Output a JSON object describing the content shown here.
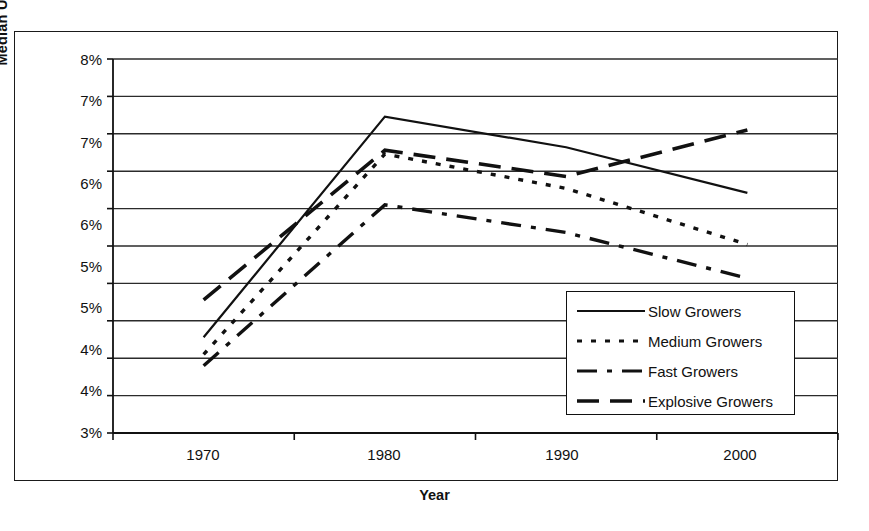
{
  "chart_data": {
    "type": "line",
    "title": "",
    "xlabel": "Year",
    "ylabel": "Median Unemployment Rate",
    "x": [
      1970,
      1980,
      1990,
      2000
    ],
    "xtick_labels": [
      "1970",
      "1980",
      "1990",
      "2000"
    ],
    "ytick_labels": [
      "3%",
      "4%",
      "4%",
      "5%",
      "5%",
      "6%",
      "6%",
      "7%",
      "7%",
      "8%"
    ],
    "ytick_values": [
      3.0,
      3.5,
      4.0,
      4.5,
      5.0,
      5.5,
      6.0,
      6.5,
      7.0,
      7.5,
      8.0
    ],
    "ylim": [
      3.0,
      8.0
    ],
    "grid": "horizontal",
    "legend_position": "inside-lower-right",
    "series": [
      {
        "name": "Slow Growers",
        "style": "solid",
        "values": [
          4.28,
          7.23,
          6.82,
          6.21
        ]
      },
      {
        "name": "Medium Growers",
        "style": "dotted",
        "values": [
          4.05,
          6.73,
          6.27,
          5.52
        ]
      },
      {
        "name": "Fast Growers",
        "style": "dash-dot",
        "values": [
          3.9,
          6.05,
          5.68,
          5.07
        ]
      },
      {
        "name": "Explosive Growers",
        "style": "long-dash",
        "values": [
          4.78,
          6.78,
          6.43,
          7.05
        ]
      }
    ]
  },
  "legend": {
    "items": [
      {
        "label": "Slow Growers",
        "style": "solid"
      },
      {
        "label": "Medium Growers",
        "style": "dotted"
      },
      {
        "label": "Fast Growers",
        "style": "dash-dot"
      },
      {
        "label": "Explosive Growers",
        "style": "long-dash"
      }
    ]
  },
  "axes": {
    "y_title": "Median Unemployment Rate",
    "x_title": "Year",
    "y_labels": [
      "8%",
      "7%",
      "7%",
      "6%",
      "6%",
      "5%",
      "5%",
      "4%",
      "4%",
      "3%"
    ],
    "x_labels": [
      "1970",
      "1980",
      "1990",
      "2000"
    ]
  },
  "colors": {
    "line": "#111111",
    "grid": "#333333",
    "frame": "#1a1a1a",
    "background": "#ffffff"
  }
}
